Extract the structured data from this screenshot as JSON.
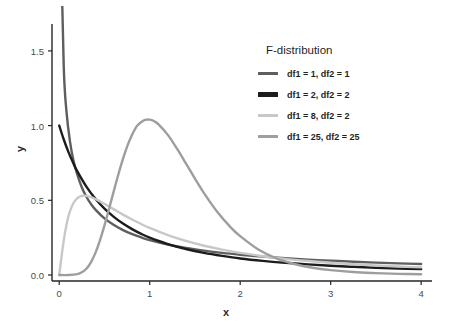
{
  "chart_data": {
    "type": "line",
    "title": "",
    "xlabel": "x",
    "ylabel": "y",
    "xlim": [
      -0.08,
      4.12
    ],
    "ylim": [
      -0.04,
      1.68
    ],
    "xticks": [
      0,
      1,
      2,
      3,
      4
    ],
    "xtick_labels": [
      "0",
      "1",
      "2",
      "3",
      "4"
    ],
    "yticks": [
      0.0,
      0.5,
      1.0,
      1.5
    ],
    "ytick_labels": [
      "0.0",
      "0.5",
      "1.0",
      "1.5"
    ],
    "grid": false,
    "legend_position": "upper right",
    "legend_title": "F-distribution",
    "series": [
      {
        "name": "df1 = 1, df2 = 1",
        "df1": 1,
        "df2": 1,
        "color": "#5e5e5e",
        "x": [
          0.02,
          0.05,
          0.08,
          0.12,
          0.16,
          0.2,
          0.25,
          0.3,
          0.35,
          0.4,
          0.5,
          0.6,
          0.7,
          0.8,
          0.9,
          1.0,
          1.2,
          1.4,
          1.6,
          1.8,
          2.0,
          2.25,
          2.5,
          2.75,
          3.0,
          3.25,
          3.5,
          3.75,
          4.0
        ],
        "y": [
          2.213,
          1.391,
          1.094,
          0.888,
          0.76,
          0.671,
          0.586,
          0.524,
          0.476,
          0.438,
          0.379,
          0.336,
          0.302,
          0.275,
          0.253,
          0.234,
          0.204,
          0.181,
          0.163,
          0.148,
          0.136,
          0.123,
          0.112,
          0.103,
          0.096,
          0.089,
          0.083,
          0.078,
          0.074
        ]
      },
      {
        "name": "df1 = 2, df2 = 2",
        "df1": 2,
        "df2": 2,
        "color": "#1c1c1c",
        "x": [
          0.0,
          0.05,
          0.1,
          0.15,
          0.2,
          0.3,
          0.4,
          0.5,
          0.6,
          0.7,
          0.8,
          0.9,
          1.0,
          1.2,
          1.4,
          1.6,
          1.8,
          2.0,
          2.25,
          2.5,
          2.75,
          3.0,
          3.25,
          3.5,
          3.75,
          4.0
        ],
        "y": [
          1.0,
          0.907,
          0.826,
          0.756,
          0.694,
          0.592,
          0.51,
          0.444,
          0.391,
          0.346,
          0.309,
          0.277,
          0.25,
          0.207,
          0.174,
          0.148,
          0.128,
          0.111,
          0.095,
          0.082,
          0.071,
          0.062,
          0.055,
          0.049,
          0.044,
          0.04
        ]
      },
      {
        "name": "df1 = 8, df2 = 2",
        "df1": 8,
        "df2": 2,
        "color": "#c8c8c8",
        "x": [
          0.0,
          0.05,
          0.1,
          0.15,
          0.2,
          0.25,
          0.3,
          0.35,
          0.4,
          0.45,
          0.5,
          0.6,
          0.7,
          0.8,
          0.9,
          1.0,
          1.2,
          1.4,
          1.6,
          1.8,
          2.0,
          2.25,
          2.5,
          2.75,
          3.0,
          3.25,
          3.5,
          3.75,
          4.0
        ],
        "y": [
          0.0,
          0.232,
          0.39,
          0.474,
          0.515,
          0.53,
          0.53,
          0.522,
          0.509,
          0.493,
          0.476,
          0.441,
          0.406,
          0.373,
          0.343,
          0.315,
          0.267,
          0.228,
          0.196,
          0.17,
          0.148,
          0.126,
          0.108,
          0.094,
          0.082,
          0.072,
          0.064,
          0.057,
          0.051
        ]
      },
      {
        "name": "df1 = 25, df2 = 25",
        "df1": 25,
        "df2": 25,
        "color": "#9e9e9e",
        "x": [
          0.0,
          0.1,
          0.2,
          0.25,
          0.3,
          0.35,
          0.4,
          0.45,
          0.5,
          0.55,
          0.6,
          0.65,
          0.7,
          0.75,
          0.8,
          0.85,
          0.88,
          0.9,
          0.95,
          1.0,
          1.05,
          1.1,
          1.2,
          1.3,
          1.4,
          1.5,
          1.6,
          1.75,
          1.9,
          2.0,
          2.2,
          2.4,
          2.6,
          2.8,
          3.0,
          3.25,
          3.5,
          3.75,
          4.0
        ],
        "y": [
          0.0,
          0.0,
          0.006,
          0.018,
          0.042,
          0.085,
          0.148,
          0.232,
          0.332,
          0.442,
          0.555,
          0.666,
          0.769,
          0.859,
          0.932,
          0.99,
          1.01,
          1.021,
          1.038,
          1.04,
          1.029,
          1.007,
          0.938,
          0.847,
          0.747,
          0.645,
          0.548,
          0.42,
          0.316,
          0.26,
          0.171,
          0.112,
          0.074,
          0.049,
          0.033,
          0.02,
          0.013,
          0.008,
          0.005
        ]
      }
    ]
  },
  "axes": {
    "spine_color": "#262626",
    "background": "#ffffff"
  }
}
